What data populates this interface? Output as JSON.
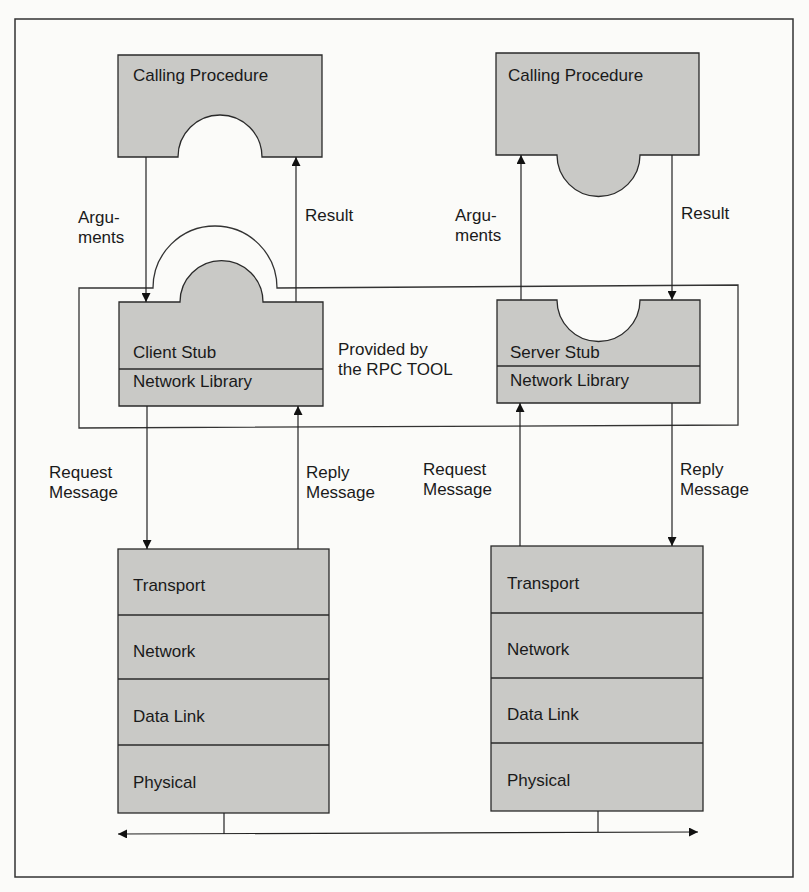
{
  "diagram": {
    "type": "rpc-architecture",
    "colors": {
      "fill": "#c9c9c6",
      "stroke": "#2a2a2a",
      "background": "#fbfbf9"
    },
    "client": {
      "calling_procedure": "Calling Procedure",
      "arguments_label": "Argu-\nments",
      "result_label": "Result",
      "stub": "Client Stub",
      "network_library": "Network Library",
      "request_label": "Request\nMessage",
      "reply_label": "Reply\nMessage",
      "layers": [
        "Transport",
        "Network",
        "Data Link",
        "Physical"
      ]
    },
    "server": {
      "calling_procedure": "Calling Procedure",
      "arguments_label": "Argu-\nments",
      "result_label": "Result",
      "stub": "Server Stub",
      "network_library": "Network Library",
      "request_label": "Request\nMessage",
      "reply_label": "Reply\nMessage",
      "layers": [
        "Transport",
        "Network",
        "Data Link",
        "Physical"
      ]
    },
    "rpc_tool_label": "Provided by\nthe RPC TOOL"
  }
}
